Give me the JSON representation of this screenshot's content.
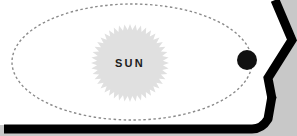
{
  "diagram": {
    "type": "astronomy-orbit-schematic",
    "canvas": {
      "width": 297,
      "height": 136
    },
    "background": {
      "outer_color": "#c8c8c8",
      "inner_color": "#ffffff"
    },
    "frame": {
      "name": "page-border",
      "color": "#000000",
      "stroke_width": 9,
      "description": "thick black border along the bottom edge rising into an angled chevron on the right side"
    },
    "sun": {
      "label": "SUN",
      "shape": "starburst",
      "fill_color": "#e0e0e0",
      "center_x": 130,
      "center_y": 63,
      "outer_radius": 39,
      "inner_radius": 33,
      "points": 44,
      "label_color": "#1c1c1c",
      "label_x": 130,
      "label_y": 63
    },
    "orbit": {
      "name": "orbital-path",
      "style": "dashed ellipse",
      "color": "#8a8a8a",
      "stroke_width": 1.4,
      "dash": "2.5 2.5",
      "center_x": 132,
      "center_y": 62,
      "radius_x": 120,
      "radius_y": 58
    },
    "planet": {
      "name": "planet-body",
      "fill_color": "#111111",
      "center_x": 247,
      "center_y": 60,
      "radius": 10
    }
  }
}
